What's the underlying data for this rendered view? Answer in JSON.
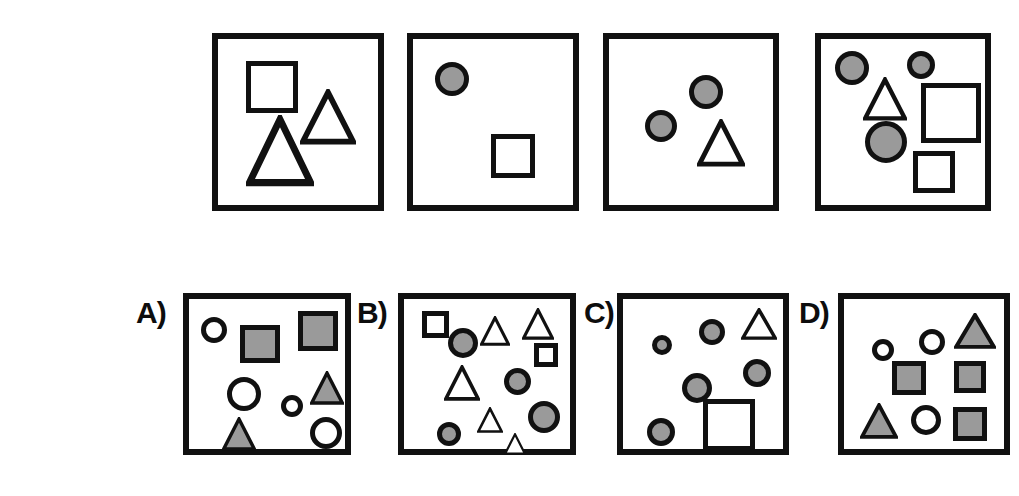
{
  "figure": {
    "title": "",
    "colors": {
      "outline": "#111111",
      "fill_gray": "#9a9a9a",
      "fill_white": "#ffffff",
      "background": "#ffffff"
    },
    "sequence_label": "",
    "options_labels": [
      "A)",
      "B)",
      "C)",
      "D)"
    ]
  },
  "sequence": [
    {
      "name": "sequence-panel-1",
      "box": {
        "x": 212,
        "y": 33,
        "w": 172,
        "h": 178
      },
      "shape_count": 3,
      "shapes": [
        {
          "type": "square",
          "fill": "white",
          "x": 28,
          "y": 22,
          "w": 52,
          "h": 52
        },
        {
          "type": "triangle",
          "fill": "white",
          "x": 82,
          "y": 50,
          "w": 56,
          "h": 56
        },
        {
          "type": "triangle",
          "fill": "white",
          "x": 28,
          "y": 76,
          "w": 68,
          "h": 72
        }
      ]
    },
    {
      "name": "sequence-panel-2",
      "box": {
        "x": 407,
        "y": 33,
        "w": 172,
        "h": 178
      },
      "shape_count": 2,
      "shapes": [
        {
          "type": "circle",
          "fill": "gray",
          "x": 22,
          "y": 23,
          "w": 34,
          "h": 34
        },
        {
          "type": "square",
          "fill": "white",
          "x": 78,
          "y": 95,
          "w": 44,
          "h": 44
        }
      ]
    },
    {
      "name": "sequence-panel-3",
      "box": {
        "x": 603,
        "y": 33,
        "w": 176,
        "h": 178
      },
      "shape_count": 3,
      "shapes": [
        {
          "type": "circle",
          "fill": "gray",
          "x": 80,
          "y": 36,
          "w": 34,
          "h": 34
        },
        {
          "type": "circle",
          "fill": "gray",
          "x": 36,
          "y": 71,
          "w": 32,
          "h": 32
        },
        {
          "type": "triangle",
          "fill": "white",
          "x": 88,
          "y": 80,
          "w": 48,
          "h": 48
        }
      ]
    },
    {
      "name": "sequence-panel-4",
      "box": {
        "x": 815,
        "y": 33,
        "w": 176,
        "h": 178
      },
      "shape_count": 6,
      "shapes": [
        {
          "type": "circle",
          "fill": "gray",
          "x": 14,
          "y": 12,
          "w": 34,
          "h": 34
        },
        {
          "type": "circle",
          "fill": "gray",
          "x": 86,
          "y": 12,
          "w": 28,
          "h": 28
        },
        {
          "type": "triangle",
          "fill": "white",
          "x": 42,
          "y": 38,
          "w": 44,
          "h": 44
        },
        {
          "type": "square",
          "fill": "white",
          "x": 100,
          "y": 44,
          "w": 60,
          "h": 60
        },
        {
          "type": "circle",
          "fill": "gray",
          "x": 44,
          "y": 82,
          "w": 42,
          "h": 42
        },
        {
          "type": "square",
          "fill": "white",
          "x": 92,
          "y": 112,
          "w": 42,
          "h": 42
        }
      ]
    }
  ],
  "options": [
    {
      "name": "option-a",
      "label": "A)",
      "label_pos": {
        "x": 136,
        "y": 298
      },
      "box": {
        "x": 183,
        "y": 293,
        "w": 168,
        "h": 162
      },
      "shape_count": 8,
      "shapes": [
        {
          "type": "circle",
          "fill": "white",
          "x": 12,
          "y": 18,
          "w": 26,
          "h": 26
        },
        {
          "type": "square",
          "fill": "gray",
          "x": 51,
          "y": 26,
          "w": 40,
          "h": 38
        },
        {
          "type": "square",
          "fill": "gray",
          "x": 109,
          "y": 12,
          "w": 40,
          "h": 40
        },
        {
          "type": "circle",
          "fill": "white",
          "x": 38,
          "y": 78,
          "w": 34,
          "h": 34
        },
        {
          "type": "circle",
          "fill": "white",
          "x": 92,
          "y": 96,
          "w": 22,
          "h": 22
        },
        {
          "type": "triangle",
          "fill": "gray",
          "x": 121,
          "y": 72,
          "w": 34,
          "h": 34
        },
        {
          "type": "triangle",
          "fill": "gray",
          "x": 33,
          "y": 118,
          "w": 34,
          "h": 34
        },
        {
          "type": "circle",
          "fill": "white",
          "x": 121,
          "y": 118,
          "w": 32,
          "h": 32
        }
      ]
    },
    {
      "name": "option-b",
      "label": "B)",
      "label_pos": {
        "x": 357,
        "y": 298
      },
      "box": {
        "x": 398,
        "y": 293,
        "w": 178,
        "h": 162
      },
      "shape_count": 11,
      "shapes": [
        {
          "type": "square",
          "fill": "white",
          "x": 18,
          "y": 12,
          "w": 27,
          "h": 27
        },
        {
          "type": "circle",
          "fill": "gray",
          "x": 44,
          "y": 29,
          "w": 30,
          "h": 30
        },
        {
          "type": "triangle",
          "fill": "white",
          "x": 76,
          "y": 17,
          "w": 30,
          "h": 30
        },
        {
          "type": "triangle",
          "fill": "white",
          "x": 118,
          "y": 9,
          "w": 32,
          "h": 32
        },
        {
          "type": "square",
          "fill": "white",
          "x": 130,
          "y": 44,
          "w": 24,
          "h": 24
        },
        {
          "type": "triangle",
          "fill": "white",
          "x": 40,
          "y": 66,
          "w": 36,
          "h": 36
        },
        {
          "type": "circle",
          "fill": "gray",
          "x": 100,
          "y": 69,
          "w": 27,
          "h": 27
        },
        {
          "type": "circle",
          "fill": "gray",
          "x": 124,
          "y": 102,
          "w": 32,
          "h": 32
        },
        {
          "type": "triangle",
          "fill": "white",
          "x": 73,
          "y": 108,
          "w": 26,
          "h": 26
        },
        {
          "type": "circle",
          "fill": "gray",
          "x": 33,
          "y": 123,
          "w": 24,
          "h": 24
        },
        {
          "type": "triangle",
          "fill": "white",
          "x": 100,
          "y": 134,
          "w": 22,
          "h": 22
        }
      ]
    },
    {
      "name": "option-c",
      "label": "C)",
      "label_pos": {
        "x": 584,
        "y": 298
      },
      "box": {
        "x": 617,
        "y": 293,
        "w": 172,
        "h": 162
      },
      "shape_count": 7,
      "shapes": [
        {
          "type": "circle",
          "fill": "gray",
          "x": 29,
          "y": 36,
          "w": 20,
          "h": 20
        },
        {
          "type": "circle",
          "fill": "gray",
          "x": 76,
          "y": 20,
          "w": 26,
          "h": 26
        },
        {
          "type": "triangle",
          "fill": "white",
          "x": 118,
          "y": 9,
          "w": 36,
          "h": 32
        },
        {
          "type": "circle",
          "fill": "gray",
          "x": 120,
          "y": 60,
          "w": 28,
          "h": 28
        },
        {
          "type": "circle",
          "fill": "gray",
          "x": 59,
          "y": 74,
          "w": 30,
          "h": 30
        },
        {
          "type": "circle",
          "fill": "gray",
          "x": 24,
          "y": 119,
          "w": 28,
          "h": 28
        },
        {
          "type": "square",
          "fill": "white",
          "x": 80,
          "y": 100,
          "w": 52,
          "h": 52
        }
      ]
    },
    {
      "name": "option-d",
      "label": "D)",
      "label_pos": {
        "x": 799,
        "y": 298
      },
      "box": {
        "x": 838,
        "y": 293,
        "w": 172,
        "h": 162
      },
      "shape_count": 8,
      "shapes": [
        {
          "type": "circle",
          "fill": "white",
          "x": 28,
          "y": 40,
          "w": 22,
          "h": 22
        },
        {
          "type": "circle",
          "fill": "white",
          "x": 75,
          "y": 30,
          "w": 26,
          "h": 26
        },
        {
          "type": "triangle",
          "fill": "gray",
          "x": 110,
          "y": 14,
          "w": 42,
          "h": 36
        },
        {
          "type": "square",
          "fill": "gray",
          "x": 48,
          "y": 62,
          "w": 34,
          "h": 34
        },
        {
          "type": "square",
          "fill": "gray",
          "x": 110,
          "y": 62,
          "w": 32,
          "h": 32
        },
        {
          "type": "triangle",
          "fill": "gray",
          "x": 16,
          "y": 104,
          "w": 38,
          "h": 36
        },
        {
          "type": "circle",
          "fill": "white",
          "x": 67,
          "y": 106,
          "w": 30,
          "h": 30
        },
        {
          "type": "square",
          "fill": "gray",
          "x": 109,
          "y": 108,
          "w": 34,
          "h": 34
        }
      ]
    }
  ]
}
